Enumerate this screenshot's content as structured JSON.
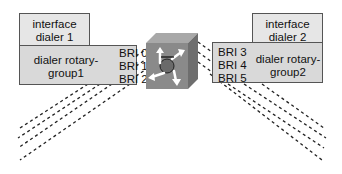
{
  "left": {
    "interface_label_1": "interface",
    "interface_label_2": "dialer 1",
    "group_label_1": "dialer rotary-",
    "group_label_2": "group1",
    "ports": [
      "BRI 0",
      "BRI 1",
      "BRI 2"
    ]
  },
  "right": {
    "interface_label_1": "interface",
    "interface_label_2": "dialer 2",
    "group_label_1": "dialer rotary-",
    "group_label_2": "group2",
    "ports": [
      "BRI 3",
      "BRI 4",
      "BRI 5"
    ]
  },
  "router": {
    "icon": "router-cube-icon"
  },
  "colors": {
    "box_fill": "#d9d9d9",
    "box_border": "#555555",
    "cube_front": "#8a8a8a",
    "cube_top": "#a8a8a8",
    "cube_side": "#6e6e6e"
  }
}
